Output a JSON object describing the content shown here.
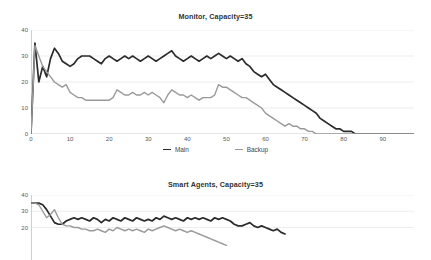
{
  "charts": [
    {
      "title": "Monitor, Capacity=35",
      "legend_position": "bottom",
      "legend": [
        {
          "label": "Main",
          "color": "#2b2b2b"
        },
        {
          "label": "Backup",
          "color": "#9a9a9a"
        }
      ],
      "chart_data": {
        "type": "line",
        "title": "Monitor, Capacity=35",
        "xlabel": "",
        "ylabel": "",
        "xlim": [
          0,
          98
        ],
        "ylim": [
          0,
          40
        ],
        "xticks": [
          0,
          10,
          20,
          30,
          40,
          50,
          60,
          70,
          80,
          90
        ],
        "yticks": [
          0,
          10,
          20,
          30,
          40
        ],
        "grid": true,
        "series": [
          {
            "name": "Main",
            "color": "#2b2b2b",
            "x": [
              0,
              1,
              2,
              3,
              4,
              5,
              6,
              7,
              8,
              9,
              10,
              11,
              12,
              13,
              14,
              15,
              16,
              17,
              18,
              19,
              20,
              21,
              22,
              23,
              24,
              25,
              26,
              27,
              28,
              29,
              30,
              31,
              32,
              33,
              34,
              35,
              36,
              37,
              38,
              39,
              40,
              41,
              42,
              43,
              44,
              45,
              46,
              47,
              48,
              49,
              50,
              51,
              52,
              53,
              54,
              55,
              56,
              57,
              58,
              59,
              60,
              61,
              62,
              63,
              64,
              65,
              66,
              67,
              68,
              69,
              70,
              71,
              72,
              73,
              74,
              75,
              76,
              77,
              78,
              79,
              80,
              81,
              82,
              83,
              84,
              85,
              86,
              87,
              88,
              89,
              90,
              91,
              92,
              93,
              94,
              95,
              96,
              97,
              98
            ],
            "values": [
              0,
              35,
              20,
              26,
              22,
              29,
              33,
              31,
              28,
              27,
              26,
              27,
              29,
              30,
              30,
              30,
              29,
              28,
              27,
              29,
              30,
              29,
              28,
              29,
              30,
              29,
              30,
              29,
              28,
              29,
              30,
              29,
              28,
              29,
              30,
              31,
              32,
              30,
              29,
              28,
              29,
              30,
              29,
              28,
              29,
              30,
              29,
              30,
              31,
              30,
              29,
              30,
              29,
              28,
              29,
              27,
              26,
              24,
              23,
              22,
              23,
              21,
              19,
              18,
              17,
              16,
              15,
              14,
              13,
              12,
              11,
              10,
              9,
              8,
              6,
              5,
              4,
              3,
              2,
              2,
              1,
              1,
              1,
              0,
              0,
              0,
              0,
              0,
              0,
              0,
              0,
              0,
              0,
              0,
              0,
              0,
              0,
              0,
              0
            ]
          },
          {
            "name": "Backup",
            "color": "#9a9a9a",
            "x": [
              0,
              1,
              2,
              3,
              4,
              5,
              6,
              7,
              8,
              9,
              10,
              11,
              12,
              13,
              14,
              15,
              16,
              17,
              18,
              19,
              20,
              21,
              22,
              23,
              24,
              25,
              26,
              27,
              28,
              29,
              30,
              31,
              32,
              33,
              34,
              35,
              36,
              37,
              38,
              39,
              40,
              41,
              42,
              43,
              44,
              45,
              46,
              47,
              48,
              49,
              50,
              51,
              52,
              53,
              54,
              55,
              56,
              57,
              58,
              59,
              60,
              61,
              62,
              63,
              64,
              65,
              66,
              67,
              68,
              69,
              70,
              71,
              72,
              73,
              74,
              75,
              76,
              77,
              78,
              79,
              80,
              81,
              82,
              83,
              84,
              85,
              86,
              87,
              88,
              89,
              90,
              91,
              92,
              93,
              94,
              95,
              96,
              97,
              98
            ],
            "values": [
              0,
              34,
              30,
              26,
              24,
              22,
              20,
              19,
              18,
              19,
              16,
              15,
              14,
              14,
              13,
              13,
              13,
              13,
              13,
              13,
              13,
              14,
              17,
              16,
              15,
              15,
              16,
              15,
              15,
              16,
              15,
              16,
              15,
              14,
              12,
              15,
              17,
              16,
              15,
              15,
              14,
              15,
              14,
              13,
              14,
              14,
              14,
              15,
              19,
              18,
              18,
              17,
              16,
              15,
              14,
              14,
              13,
              12,
              11,
              10,
              8,
              7,
              6,
              5,
              4,
              3,
              4,
              3,
              3,
              2,
              2,
              1,
              1,
              0,
              0,
              0,
              0,
              0,
              0,
              0,
              0,
              0,
              0,
              0,
              0,
              0,
              0,
              0,
              0,
              0,
              0,
              0,
              0,
              0,
              0,
              0,
              0,
              0,
              0
            ]
          }
        ]
      }
    },
    {
      "title": "Smart Agents, Capacity=35",
      "legend_position": "none",
      "legend": [],
      "chart_data": {
        "type": "line",
        "title": "Smart Agents, Capacity=35",
        "xlabel": "",
        "ylabel": "",
        "xlim": [
          0,
          98
        ],
        "ylim": [
          0,
          40
        ],
        "xticks": [],
        "yticks": [
          20,
          30,
          40
        ],
        "grid": true,
        "note": "Plot is cropped by the bottom edge of the screenshot",
        "series": [
          {
            "name": "Main",
            "color": "#2b2b2b",
            "x": [
              0,
              1,
              2,
              3,
              4,
              5,
              6,
              7,
              8,
              9,
              10,
              11,
              12,
              13,
              14,
              15,
              16,
              17,
              18,
              19,
              20,
              21,
              22,
              23,
              24,
              25,
              26,
              27,
              28,
              29,
              30,
              31,
              32,
              33,
              34,
              35,
              36,
              37,
              38,
              39,
              40,
              41,
              42,
              43,
              44,
              45,
              46,
              47,
              48,
              49,
              50,
              51,
              52,
              53,
              54,
              55,
              56,
              57,
              58,
              59,
              60,
              61,
              62,
              63,
              64,
              65,
              66,
              67,
              68,
              69,
              70
            ],
            "values": [
              35,
              35,
              35,
              34,
              31,
              27,
              23,
              22,
              22,
              24,
              25,
              26,
              25,
              26,
              25,
              24,
              26,
              25,
              23,
              25,
              24,
              26,
              25,
              24,
              26,
              25,
              24,
              26,
              25,
              24,
              25,
              24,
              26,
              25,
              27,
              26,
              25,
              26,
              25,
              24,
              26,
              25,
              26,
              25,
              26,
              25,
              24,
              26,
              25,
              26,
              25,
              24,
              22,
              21,
              21,
              22,
              23,
              21,
              20,
              21,
              20,
              19,
              18,
              19,
              17,
              16
            ]
          },
          {
            "name": "Backup",
            "color": "#9a9a9a",
            "x": [
              0,
              1,
              2,
              3,
              4,
              5,
              6,
              7,
              8,
              9,
              10,
              11,
              12,
              13,
              14,
              15,
              16,
              17,
              18,
              19,
              20,
              21,
              22,
              23,
              24,
              25,
              26,
              27,
              28,
              29,
              30,
              31,
              32,
              33,
              34,
              35,
              36,
              37,
              38,
              39,
              40,
              41,
              42,
              43,
              44,
              45,
              46,
              47,
              48,
              49,
              50,
              51,
              52,
              53,
              54,
              55,
              56,
              57,
              58,
              59,
              60
            ],
            "values": [
              35,
              35,
              34,
              30,
              26,
              28,
              31,
              26,
              22,
              21,
              21,
              20,
              20,
              19,
              19,
              18,
              18,
              19,
              18,
              17,
              19,
              18,
              20,
              19,
              18,
              19,
              18,
              19,
              18,
              17,
              19,
              18,
              19,
              20,
              21,
              20,
              19,
              18,
              19,
              18,
              17,
              18,
              17,
              16,
              15,
              14,
              13,
              12,
              11,
              10,
              9
            ]
          }
        ]
      }
    }
  ]
}
